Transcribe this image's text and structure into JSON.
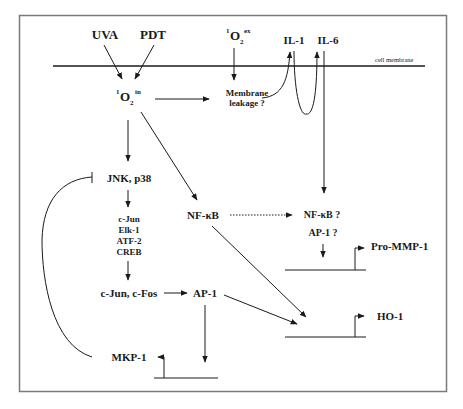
{
  "diagram": {
    "membrane_label": "cell membrane",
    "stimuli": {
      "uva": "UVA",
      "pdt": "PDT"
    },
    "singlet_oxygen_extracellular": {
      "pre": "1",
      "base": "O",
      "sub": "2",
      "sup": "ex"
    },
    "singlet_oxygen_intracellular": {
      "pre": "1",
      "base": "O",
      "sub": "2",
      "sup": "in"
    },
    "membrane_leakage": {
      "line1": "Membrane",
      "line2": "leakage ?"
    },
    "cytokines": {
      "il1": "IL-1",
      "il6": "IL-6"
    },
    "kinases": "JNK, p38",
    "transcription_factors": [
      "c-Jun",
      "Elk-1",
      "ATF-2",
      "CREB"
    ],
    "nfkb": "NF-κB",
    "nfkb_question": "NF-κB ?",
    "ap1_question": "AP-1 ?",
    "cjun_cfos": "c-Jun, c-Fos",
    "ap1": "AP-1",
    "genes": {
      "pro_mmp1": "Pro-MMP-1",
      "ho1": "HO-1",
      "mkp1": "MKP-1"
    }
  },
  "edges": [
    {
      "from": "UVA",
      "to": "1O2 in",
      "type": "activation"
    },
    {
      "from": "PDT",
      "to": "1O2 in",
      "type": "activation"
    },
    {
      "from": "1O2 ex",
      "to": "Membrane leakage ?",
      "type": "activation"
    },
    {
      "from": "1O2 in",
      "to": "Membrane leakage ?",
      "type": "activation"
    },
    {
      "from": "Membrane leakage ?",
      "to": "IL-1",
      "type": "activation"
    },
    {
      "from": "IL-1",
      "to": "IL-6",
      "type": "activation"
    },
    {
      "from": "IL-6",
      "to": "NF-κB ? / AP-1 ?",
      "type": "activation"
    },
    {
      "from": "1O2 in",
      "to": "JNK, p38",
      "type": "activation"
    },
    {
      "from": "1O2 in",
      "to": "NF-κB",
      "type": "activation"
    },
    {
      "from": "JNK, p38",
      "to": "c-Jun / Elk-1 / ATF-2 / CREB",
      "type": "activation"
    },
    {
      "from": "c-Jun / Elk-1 / ATF-2 / CREB",
      "to": "c-Jun, c-Fos",
      "type": "activation"
    },
    {
      "from": "c-Jun, c-Fos",
      "to": "AP-1",
      "type": "activation"
    },
    {
      "from": "NF-κB",
      "to": "NF-κB ?",
      "type": "possible"
    },
    {
      "from": "NF-κB ? / AP-1 ?",
      "to": "Pro-MMP-1",
      "type": "transcription"
    },
    {
      "from": "NF-κB",
      "to": "HO-1",
      "type": "transcription"
    },
    {
      "from": "AP-1",
      "to": "HO-1",
      "type": "transcription"
    },
    {
      "from": "AP-1",
      "to": "MKP-1",
      "type": "transcription"
    },
    {
      "from": "MKP-1",
      "to": "JNK, p38",
      "type": "inhibition"
    }
  ]
}
